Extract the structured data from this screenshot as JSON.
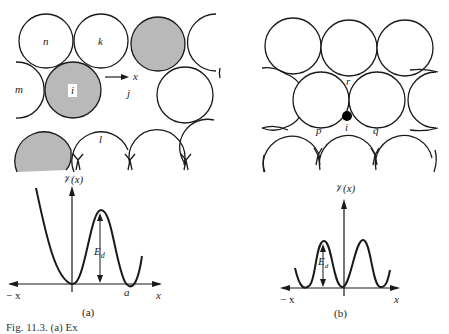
{
  "panel_a": {
    "atom_labels": {
      "n": "n",
      "k": "k",
      "m": "m",
      "i": "i",
      "j": "j",
      "l": "l"
    },
    "direction_label": "x",
    "plot": {
      "y_label": "𝒱(x)",
      "neg_x_label": "− x",
      "x_label": "x",
      "a_label": "a",
      "barrier_label": "E",
      "barrier_sub": "d"
    },
    "tag": "(a)"
  },
  "panel_b": {
    "atom_labels": {
      "r": "r",
      "p": "p",
      "i": "i",
      "q": "q"
    },
    "plot": {
      "y_label": "𝒱(x)",
      "neg_x_label": "− x",
      "x_label": "x",
      "barrier_label": "E",
      "barrier_sub": "d",
      "barrier_prime": "′"
    },
    "tag": "(b)"
  },
  "caption": "Fig. 11.3. (a) Ex",
  "colors": {
    "shaded_atom": "#b9b9b9",
    "line": "#1a1a1a",
    "adatom": "#000000"
  }
}
